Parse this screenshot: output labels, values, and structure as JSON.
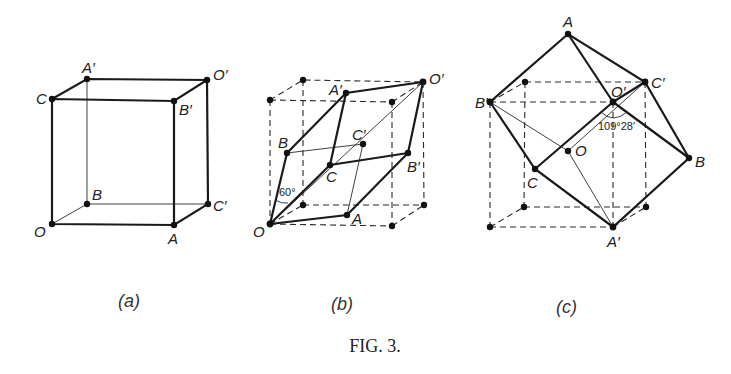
{
  "figure": {
    "caption": "Fig. 3.",
    "caption_display": "FIG. 3.",
    "panels": [
      {
        "id": "a",
        "label": "(a)",
        "vertex_labels": [
          "O",
          "A",
          "B",
          "C",
          "A′",
          "B′",
          "C′",
          "O′"
        ]
      },
      {
        "id": "b",
        "label": "(b)",
        "vertex_labels": [
          "O",
          "A",
          "B",
          "C",
          "A′",
          "B′",
          "C′",
          "O′"
        ],
        "angle_annotation": "60°"
      },
      {
        "id": "c",
        "label": "(c)",
        "vertex_labels": [
          "O",
          "A",
          "B",
          "C",
          "A′",
          "B′",
          "C′",
          "O′"
        ],
        "angle_annotation": "109°28′"
      }
    ]
  }
}
